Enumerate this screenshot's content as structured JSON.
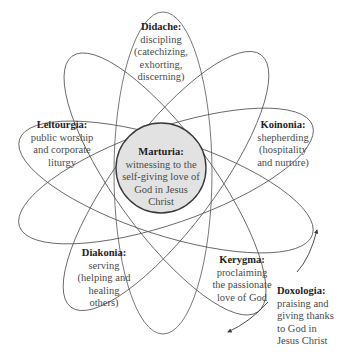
{
  "diagram": {
    "type": "ellipse-atom",
    "colors": {
      "stroke": "#4a4a4a",
      "center_fill": "#e2e2e2",
      "center_stroke": "#3a3a3a",
      "background": "#ffffff"
    },
    "center": {
      "id": "marturia",
      "title": "Marturia:",
      "desc": "witnessing to the\nself-giving love of\nGod in Jesus\nChrist"
    },
    "petals": [
      {
        "id": "didache",
        "title": "Didache:",
        "desc": "discipling\n(catechizing,\nexhorting,\ndiscerning)"
      },
      {
        "id": "leitourgia",
        "title": "Leitourgia:",
        "desc": "public worship\nand corporate\nliturgy"
      },
      {
        "id": "koinonia",
        "title": "Koinonia:",
        "desc": "shepherding\n(hospitality\nand nurture)"
      },
      {
        "id": "diakonia",
        "title": "Diakonia:",
        "desc": "serving\n(helping and\nhealing\nothers)"
      },
      {
        "id": "kerygma",
        "title": "Kerygma:",
        "desc": "proclaiming\nthe passionate\nlove of God"
      }
    ],
    "outer": {
      "id": "doxologia",
      "title": "Doxologia:",
      "desc": "praising and\ngiving thanks\nto God in\nJesus Christ"
    }
  }
}
